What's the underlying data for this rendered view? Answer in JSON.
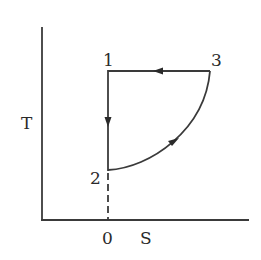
{
  "diagram": {
    "type": "T-S cycle diagram",
    "axes": {
      "y_label": "T",
      "x_label": "S",
      "origin_tick_label": "0"
    },
    "points": [
      {
        "id": "1",
        "label": "1"
      },
      {
        "id": "2",
        "label": "2"
      },
      {
        "id": "3",
        "label": "3"
      }
    ],
    "paths": [
      {
        "from": "1",
        "to": "2",
        "kind": "vertical line",
        "arrow": "down"
      },
      {
        "from": "2",
        "to": "3",
        "kind": "curve",
        "arrow": "up-right"
      },
      {
        "from": "3",
        "to": "1",
        "kind": "horizontal line",
        "arrow": "left"
      },
      {
        "from": "2",
        "to": "0",
        "kind": "dashed line",
        "arrow": "none"
      }
    ],
    "colors": {
      "stroke": "#3a3a3a",
      "background": "#ffffff"
    }
  }
}
